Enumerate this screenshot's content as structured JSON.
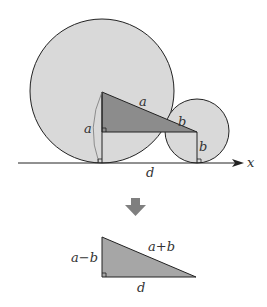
{
  "diagram": {
    "top_figure": {
      "labels": {
        "hyp_a": "a",
        "hyp_b": "b",
        "arc_a": "a",
        "vert_b": "b",
        "base_d": "d",
        "axis_x": "x"
      }
    },
    "bottom_figure": {
      "labels": {
        "vertical": "a−b",
        "hypotenuse": "a+b",
        "base": "d"
      }
    },
    "colors": {
      "circle_fill": "#d9d9d9",
      "dark_triangle_fill": "#8c8c8c",
      "result_triangle_fill": "#a6a6a6",
      "arrow_fill": "#7f7f7f",
      "stroke": "#222222"
    }
  }
}
